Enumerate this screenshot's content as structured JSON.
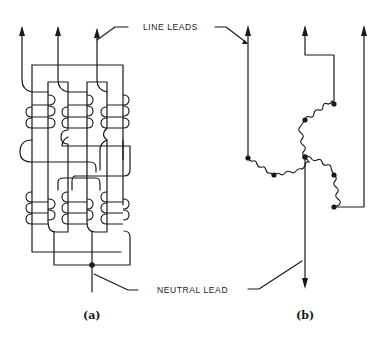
{
  "figure": {
    "labels": {
      "line_leads": "LINE LEADS",
      "neutral_lead": "NEUTRAL LEAD"
    },
    "panels": [
      {
        "caption": "(a)",
        "description": "Physical winding layout of three-phase wye-connected coils with three line leads and common neutral"
      },
      {
        "caption": "(b)",
        "description": "Schematic wye (star) connection with three coil groups joined at neutral point"
      }
    ]
  }
}
